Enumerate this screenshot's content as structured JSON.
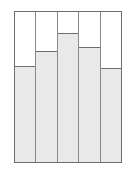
{
  "chart_data": {
    "type": "bar",
    "title": "",
    "subtitle": "",
    "xlabel": "",
    "ylabel": "",
    "categories": [
      "1",
      "2",
      "3",
      "4",
      "5"
    ],
    "values": [
      64,
      74,
      86,
      77,
      63
    ],
    "ylim": [
      0,
      100
    ],
    "grid": false,
    "legend": false,
    "legend_position": "none",
    "bar_gap": 0,
    "annotations": [],
    "tick_labels": {
      "x": [],
      "y": []
    }
  },
  "style": {
    "bar_fill": "#e9e9e9",
    "bar_stroke": "#6e6e6e",
    "separator": "#8a8a8a",
    "frame": "#6e6e6e",
    "background": "#ffffff"
  },
  "bars": [
    {
      "name": "bar-1",
      "category": "1",
      "value": 64
    },
    {
      "name": "bar-2",
      "category": "2",
      "value": 74
    },
    {
      "name": "bar-3",
      "category": "3",
      "value": 86
    },
    {
      "name": "bar-4",
      "category": "4",
      "value": 77
    },
    {
      "name": "bar-5",
      "category": "5",
      "value": 63
    }
  ]
}
